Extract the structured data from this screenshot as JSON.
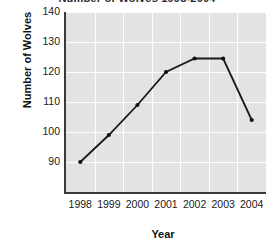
{
  "chart_data": {
    "type": "line",
    "title": "Number of Wolves 1998-2004",
    "xlabel": "Year",
    "ylabel": "Number of Wolves",
    "categories": [
      "1998",
      "1999",
      "2000",
      "2001",
      "2002",
      "2003",
      "2004"
    ],
    "values": [
      90,
      99,
      109,
      120,
      124.5,
      124.5,
      104
    ],
    "series": [
      {
        "name": "Number of Wolves",
        "values": [
          90,
          99,
          109,
          120,
          124.5,
          124.5,
          104
        ]
      }
    ],
    "x_tick_labels": [
      "1998",
      "1999",
      "2000",
      "2001",
      "2002",
      "2003",
      "2004"
    ],
    "y_tick_labels": [
      "140",
      "130",
      "120",
      "110",
      "100",
      "90"
    ],
    "y_tick_values": [
      140,
      130,
      120,
      110,
      100,
      90
    ],
    "ylim": [
      80,
      140
    ],
    "xlim": [
      1997.5,
      2004.5
    ],
    "grid": true,
    "legend": false,
    "legend_position": "none",
    "marker": "filled-circle",
    "line_color": "#1a1a1a",
    "marker_color": "#111111",
    "plot_background_color": "#e3e3e3",
    "gridline_color": "#fdfdfd",
    "axis_color": "#3a3a3a",
    "figure_background_color": "#ffffff",
    "annotations": []
  }
}
